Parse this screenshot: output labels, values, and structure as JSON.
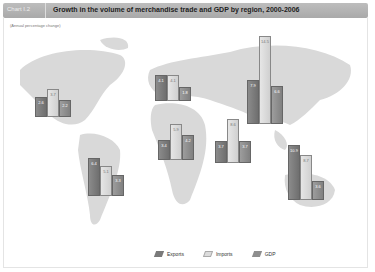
{
  "header": {
    "chart_id": "Chart I.2",
    "title": "Growth in the volume of merchandise trade and GDP by region, 2000-2006",
    "subtitle": "(Annual percentage change)"
  },
  "legend": [
    {
      "label": "Exports",
      "color": "#7a7a7a"
    },
    {
      "label": "Imports",
      "color": "#dcdcdc"
    },
    {
      "label": "GDP",
      "color": "#8e8e8e"
    }
  ],
  "chart_data": {
    "type": "bar",
    "title": "Growth in the volume of merchandise trade and GDP by region, 2000-2006",
    "subtitle": "(Annual percentage change)",
    "xlabel": "",
    "ylabel": "Annual percentage change",
    "categories": [
      "North America",
      "Europe",
      "CIS",
      "South and Central America",
      "Africa",
      "Middle East",
      "Asia"
    ],
    "series": [
      {
        "name": "Exports",
        "values": [
          2.6,
          4.1,
          7.9,
          6.4,
          3.4,
          3.7,
          10.9
        ]
      },
      {
        "name": "Imports",
        "values": [
          3.7,
          4.1,
          14.5,
          5.1,
          5.9,
          8.6,
          8.7
        ]
      },
      {
        "name": "GDP",
        "values": [
          2.2,
          1.8,
          6.6,
          3.3,
          4.2,
          3.7,
          3.6
        ]
      }
    ],
    "legend_position": "bottom",
    "grid": false
  },
  "clusters": [
    {
      "x": 35,
      "base": 117,
      "vals": [
        "2.6",
        "3.7",
        "2.2"
      ],
      "h": [
        20,
        28,
        17
      ]
    },
    {
      "x": 155,
      "base": 101,
      "vals": [
        "4.1",
        "4.1",
        "1.8"
      ],
      "h": [
        26,
        26,
        14
      ]
    },
    {
      "x": 247,
      "base": 124,
      "vals": [
        "7.9",
        "14.5",
        "6.6"
      ],
      "h": [
        44,
        88,
        38
      ]
    },
    {
      "x": 88,
      "base": 196,
      "vals": [
        "6.4",
        "5.1",
        "3.3"
      ],
      "h": [
        38,
        30,
        21
      ]
    },
    {
      "x": 158,
      "base": 160,
      "vals": [
        "3.4",
        "5.9",
        "4.2"
      ],
      "h": [
        20,
        36,
        25
      ]
    },
    {
      "x": 215,
      "base": 163,
      "vals": [
        "3.7",
        "8.6",
        "3.7"
      ],
      "h": [
        22,
        44,
        22
      ]
    },
    {
      "x": 288,
      "base": 200,
      "vals": [
        "10.9",
        "8.7",
        "3.6"
      ],
      "h": [
        55,
        45,
        19
      ]
    }
  ]
}
